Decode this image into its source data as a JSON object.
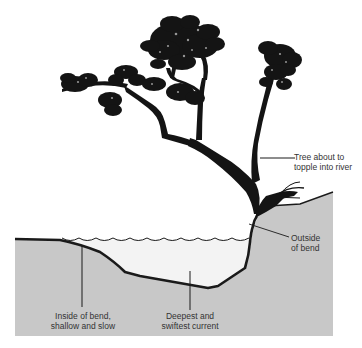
{
  "diagram": {
    "colors": {
      "background": "#ffffff",
      "ground": "#c8c8c8",
      "water": "#f3f3f3",
      "outline": "#1a1a1a",
      "tree": "#141414",
      "text": "#333333"
    },
    "labels": [
      {
        "id": "tree",
        "text": "Tree about to\ntopple into river"
      },
      {
        "id": "outside",
        "text": "Outside\nof bend"
      },
      {
        "id": "inside",
        "text": "Inside of bend,\nshallow and slow"
      },
      {
        "id": "deepest",
        "text": "Deepest and\nswiftest current"
      }
    ]
  }
}
